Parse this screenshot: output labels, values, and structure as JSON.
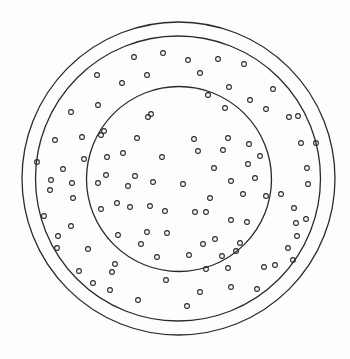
{
  "figure": {
    "width": 350,
    "height": 359,
    "background": "#fdfdfd",
    "stroke_color": "#2a2a2a",
    "rings": [
      {
        "name": "outer-ring",
        "cx": 178.5,
        "cy": 178.5,
        "r": 156.5,
        "stroke_width": 1.3
      },
      {
        "name": "middle-ring",
        "cx": 178,
        "cy": 178.5,
        "r": 142.5,
        "stroke_width": 1.3
      },
      {
        "name": "inner-ring",
        "cx": 179,
        "cy": 179,
        "r": 92.5,
        "stroke_width": 1.3
      }
    ],
    "dots": {
      "radius": 2.4,
      "stroke_width": 1.1,
      "inner": [
        [
          208,
          95
        ],
        [
          250,
          100
        ],
        [
          148,
          117
        ],
        [
          225,
          108
        ],
        [
          266,
          109
        ],
        [
          104,
          131
        ],
        [
          137,
          138
        ],
        [
          194,
          139
        ],
        [
          228,
          138
        ],
        [
          249,
          144
        ],
        [
          107,
          157
        ],
        [
          123,
          153
        ],
        [
          162,
          157
        ],
        [
          198,
          151
        ],
        [
          223,
          150
        ],
        [
          260,
          156
        ],
        [
          106,
          175
        ],
        [
          135,
          176
        ],
        [
          214,
          168
        ],
        [
          248,
          164
        ],
        [
          98,
          183
        ],
        [
          128,
          186
        ],
        [
          153,
          182
        ],
        [
          183,
          184
        ],
        [
          231,
          181
        ],
        [
          255,
          178
        ],
        [
          117,
          203
        ],
        [
          150,
          206
        ],
        [
          210,
          198
        ],
        [
          243,
          194
        ],
        [
          266,
          196
        ],
        [
          101,
          209
        ],
        [
          130,
          207
        ],
        [
          165,
          211
        ],
        [
          206,
          212
        ],
        [
          231,
          220
        ],
        [
          118,
          235
        ],
        [
          147,
          232
        ],
        [
          195,
          212
        ],
        [
          215,
          239
        ],
        [
          247,
          222
        ],
        [
          141,
          244
        ],
        [
          167,
          233
        ],
        [
          203,
          244
        ],
        [
          240,
          243
        ],
        [
          157,
          257
        ],
        [
          189,
          255
        ],
        [
          222,
          256
        ]
      ],
      "outer_band": [
        [
          134,
          57
        ],
        [
          163,
          53
        ],
        [
          188,
          60
        ],
        [
          218,
          59
        ],
        [
          244,
          64
        ],
        [
          97,
          75
        ],
        [
          122,
          83
        ],
        [
          147,
          75
        ],
        [
          200,
          73
        ],
        [
          229,
          87
        ],
        [
          273,
          89
        ],
        [
          71,
          112
        ],
        [
          98,
          105
        ],
        [
          101,
          135
        ],
        [
          151,
          114
        ],
        [
          55,
          140
        ],
        [
          82,
          137
        ],
        [
          298,
          116
        ],
        [
          289,
          117
        ],
        [
          37,
          162
        ],
        [
          84,
          159
        ],
        [
          63,
          169
        ],
        [
          301,
          143
        ],
        [
          316,
          143
        ],
        [
          51,
          180
        ],
        [
          73,
          198
        ],
        [
          307,
          168
        ],
        [
          308,
          184
        ],
        [
          50,
          190
        ],
        [
          72,
          183
        ],
        [
          294,
          208
        ],
        [
          281,
          194
        ],
        [
          44,
          216
        ],
        [
          71,
          226
        ],
        [
          58,
          236
        ],
        [
          296,
          223
        ],
        [
          306,
          219
        ],
        [
          88,
          249
        ],
        [
          79,
          271
        ],
        [
          57,
          248
        ],
        [
          297,
          236
        ],
        [
          293,
          260
        ],
        [
          93,
          283
        ],
        [
          110,
          290
        ],
        [
          138,
          300
        ],
        [
          112,
          272
        ],
        [
          236,
          251
        ],
        [
          115,
          264
        ],
        [
          166,
          280
        ],
        [
          187,
          306
        ],
        [
          200,
          292
        ],
        [
          231,
          287
        ],
        [
          257,
          289
        ],
        [
          206,
          269
        ],
        [
          228,
          268
        ],
        [
          264,
          267
        ],
        [
          275,
          265
        ],
        [
          288,
          248
        ]
      ]
    }
  }
}
